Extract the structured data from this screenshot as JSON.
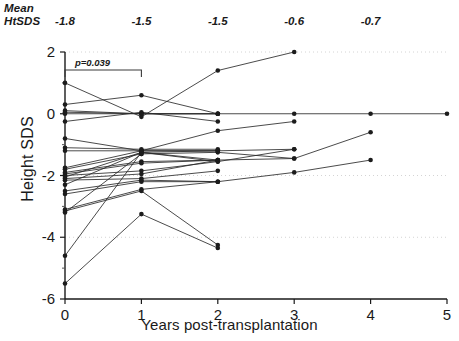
{
  "annotations": {
    "mean_label_line1": "Mean",
    "mean_label_line2": "HtSDS",
    "mean_values": [
      "-1.8",
      "-1.5",
      "-1.5",
      "-0.6",
      "-0.7"
    ],
    "mean_value_x": [
      0,
      1,
      2,
      3,
      4
    ],
    "pvalue_text": "p=0.039",
    "pvalue_bracket_from": 0,
    "pvalue_bracket_to": 1
  },
  "chart_data": {
    "type": "line",
    "title": "",
    "subtitle": "",
    "xlabel": "Years post-transplantation",
    "ylabel": "Height SDS",
    "xlim": [
      0,
      5
    ],
    "ylim": [
      -6,
      2
    ],
    "xticks": [
      0,
      1,
      2,
      3,
      4,
      5
    ],
    "xtick_labels": [
      "0",
      "1",
      "2",
      "3",
      "4",
      "5"
    ],
    "yticks": [
      2,
      0,
      -2,
      -4,
      -6
    ],
    "ytick_labels": [
      "2",
      "0",
      "-2",
      "-4",
      "-6"
    ],
    "yminorticks": [
      1,
      -1,
      -3,
      -5
    ],
    "grid": "faint-dotted-horizontal",
    "gridlines_y": [
      2,
      -2,
      -4
    ],
    "legend": "none",
    "marker": "filled-circle",
    "series": [
      {
        "name": "patient-1",
        "x": [
          0,
          1,
          2,
          3
        ],
        "values": [
          1.0,
          -0.1,
          1.4,
          2.0
        ]
      },
      {
        "name": "patient-2",
        "x": [
          0,
          1,
          2
        ],
        "values": [
          0.3,
          0.6,
          0.0
        ]
      },
      {
        "name": "patient-3",
        "x": [
          0,
          1,
          2
        ],
        "values": [
          0.1,
          0.0,
          0.0
        ]
      },
      {
        "name": "patient-4",
        "x": [
          0,
          1,
          2
        ],
        "values": [
          0.0,
          0.0,
          0.0
        ]
      },
      {
        "name": "patient-5",
        "x": [
          0,
          1,
          2,
          3,
          4,
          5
        ],
        "values": [
          0.05,
          0.0,
          0.0,
          0.0,
          0.0,
          0.0
        ]
      },
      {
        "name": "patient-6",
        "x": [
          0,
          1,
          2
        ],
        "values": [
          -0.25,
          0.05,
          -0.25
        ]
      },
      {
        "name": "patient-7",
        "x": [
          0,
          1,
          2,
          3
        ],
        "values": [
          -0.8,
          -1.2,
          -0.55,
          -0.25
        ]
      },
      {
        "name": "patient-8",
        "x": [
          0,
          1,
          2
        ],
        "values": [
          -1.1,
          -1.15,
          -1.15
        ]
      },
      {
        "name": "patient-9",
        "x": [
          0,
          1,
          2
        ],
        "values": [
          -1.2,
          -1.2,
          -1.2
        ]
      },
      {
        "name": "patient-10",
        "x": [
          0,
          1,
          2,
          3
        ],
        "values": [
          -1.75,
          -1.2,
          -1.2,
          -1.15
        ]
      },
      {
        "name": "patient-11",
        "x": [
          0,
          1,
          2,
          3
        ],
        "values": [
          -1.8,
          -1.3,
          -1.25,
          -1.45
        ]
      },
      {
        "name": "patient-12",
        "x": [
          0,
          1,
          2
        ],
        "values": [
          -1.9,
          -1.55,
          -1.5
        ]
      },
      {
        "name": "patient-13",
        "x": [
          0,
          1,
          2
        ],
        "values": [
          -1.95,
          -1.6,
          -1.5
        ]
      },
      {
        "name": "patient-14",
        "x": [
          0,
          1,
          2
        ],
        "values": [
          -2.0,
          -1.85,
          -1.55
        ]
      },
      {
        "name": "patient-15",
        "x": [
          0,
          1,
          2,
          3,
          4
        ],
        "values": [
          -2.05,
          -1.25,
          -1.5,
          -1.45,
          -0.6
        ]
      },
      {
        "name": "patient-16",
        "x": [
          0,
          1,
          2
        ],
        "values": [
          -2.1,
          -1.95,
          -1.5
        ]
      },
      {
        "name": "patient-17",
        "x": [
          0,
          1,
          2
        ],
        "values": [
          -2.15,
          -2.1,
          -1.85
        ]
      },
      {
        "name": "patient-18",
        "x": [
          0,
          1,
          2,
          3
        ],
        "values": [
          -2.3,
          -1.25,
          -1.55,
          -1.15
        ]
      },
      {
        "name": "patient-19",
        "x": [
          0,
          1,
          2
        ],
        "values": [
          -2.5,
          -2.15,
          -2.2
        ]
      },
      {
        "name": "patient-20",
        "x": [
          0,
          1,
          2
        ],
        "values": [
          -2.6,
          -2.2,
          -2.2
        ]
      },
      {
        "name": "patient-21",
        "x": [
          0,
          1,
          2,
          3,
          4
        ],
        "values": [
          -3.1,
          -2.45,
          -2.2,
          -1.9,
          -1.5
        ]
      },
      {
        "name": "patient-22",
        "x": [
          0,
          1,
          2
        ],
        "values": [
          -3.15,
          -2.5,
          -4.25
        ]
      },
      {
        "name": "patient-23",
        "x": [
          0,
          1
        ],
        "values": [
          -3.2,
          -1.3
        ]
      },
      {
        "name": "patient-24",
        "x": [
          0,
          1,
          2
        ],
        "values": [
          -4.6,
          -1.25,
          -1.2
        ]
      },
      {
        "name": "patient-25",
        "x": [
          0,
          1,
          2
        ],
        "values": [
          -5.5,
          -3.25,
          -4.35
        ]
      }
    ]
  }
}
